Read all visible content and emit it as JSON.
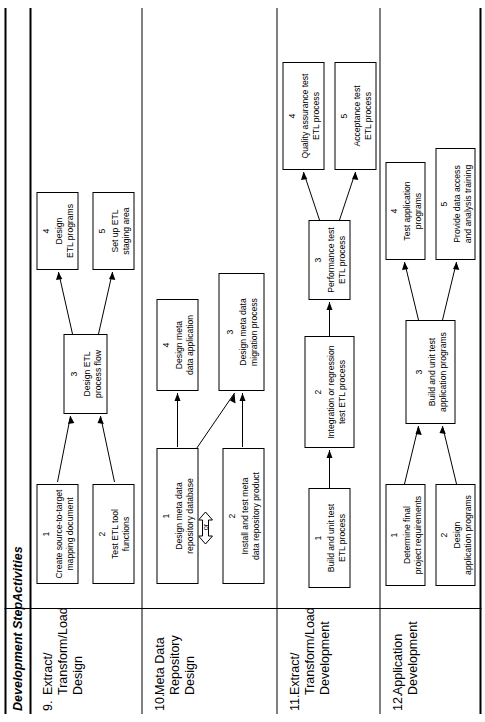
{
  "header": {
    "col_step": "Development Step",
    "col_activities": "Activities"
  },
  "rows": [
    {
      "id": "row-9",
      "number": "9.",
      "label": "Extract/\nTransform/Load\nDesign",
      "label_lines": [
        "Extract/",
        "Transform/Load",
        "Design"
      ],
      "nodes": [
        {
          "num": "1",
          "label": "Create source-to-target\nmapping document",
          "lines": [
            "Create source-to-target",
            "mapping document"
          ]
        },
        {
          "num": "2",
          "label": "Test ETL tool\nfunctions",
          "lines": [
            "Test ETL tool",
            "functions"
          ]
        },
        {
          "num": "3",
          "label": "Design ETL\nprocess flow",
          "lines": [
            "Design ETL",
            "process flow"
          ]
        },
        {
          "num": "4",
          "label": "Design\nETL programs",
          "lines": [
            "Design",
            "ETL programs"
          ]
        },
        {
          "num": "5",
          "label": "Set up ETL\nstaging area",
          "lines": [
            "Set up ETL",
            "staging area"
          ]
        }
      ]
    },
    {
      "id": "row-10",
      "number": "10.",
      "label": "Meta Data\nRepository\nDesign",
      "label_lines": [
        "Meta Data",
        "Repository",
        "Design"
      ],
      "or_label": "or",
      "nodes": [
        {
          "num": "1",
          "label": "Design meta data\nrepository database",
          "lines": [
            "Design meta data",
            "repository database"
          ]
        },
        {
          "num": "2",
          "label": "Install and test meta\ndata repository product",
          "lines": [
            "Install and test meta",
            "data repository product"
          ]
        },
        {
          "num": "4",
          "label": "Design meta\ndata application",
          "lines": [
            "Design meta",
            "data application"
          ]
        },
        {
          "num": "3",
          "label": "Design meta data\nmigration process",
          "lines": [
            "Design meta data",
            "migration process"
          ]
        }
      ]
    },
    {
      "id": "row-11",
      "number": "11.",
      "label": "Extract/\nTransform/Load\nDevelopment",
      "label_lines": [
        "Extract/",
        "Transform/Load",
        "Development"
      ],
      "nodes": [
        {
          "num": "1",
          "label": "Build and unit test\nETL process",
          "lines": [
            "Build and unit test",
            "ETL process"
          ]
        },
        {
          "num": "2",
          "label": "Integration or regression\ntest ETL process",
          "lines": [
            "Integration or regression",
            "test ETL process"
          ]
        },
        {
          "num": "3",
          "label": "Performance test\nETL process",
          "lines": [
            "Performance test",
            "ETL process"
          ]
        },
        {
          "num": "4",
          "label": "Quality assurance test\nETL process",
          "lines": [
            "Quality assurance test",
            "ETL process"
          ]
        },
        {
          "num": "5",
          "label": "Acceptance test\nETL process",
          "lines": [
            "Acceptance test",
            "ETL process"
          ]
        }
      ]
    },
    {
      "id": "row-12",
      "number": "12.",
      "label": "Application\nDevelopment",
      "label_lines": [
        "Application",
        "Development"
      ],
      "nodes": [
        {
          "num": "1",
          "label": "Determine final\nproject requirements",
          "lines": [
            "Determine final",
            "project requirements"
          ]
        },
        {
          "num": "2",
          "label": "Design\napplication programs",
          "lines": [
            "Design",
            "application programs"
          ]
        },
        {
          "num": "3",
          "label": "Build and unit test\napplication programs",
          "lines": [
            "Build and unit test",
            "application programs"
          ]
        },
        {
          "num": "4",
          "label": "Test application\nprograms",
          "lines": [
            "Test application",
            "programs"
          ]
        },
        {
          "num": "5",
          "label": "Provide data access\nand analysis training",
          "lines": [
            "Provide data access",
            "and analysis training"
          ]
        }
      ]
    }
  ],
  "colors": {
    "ink": "#000000",
    "paper": "#ffffff"
  }
}
